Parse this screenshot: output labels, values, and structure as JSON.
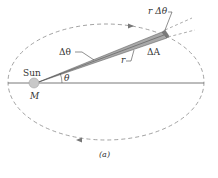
{
  "labels": {
    "r_delta_theta": "r Δθ",
    "delta_theta": "Δθ",
    "delta_A": "ΔA",
    "r": "r",
    "sun": "Sun",
    "mass": "M",
    "theta": "θ",
    "caption": "(a)"
  },
  "colors": {
    "orbit": "#8a8a8a",
    "axis": "#555555",
    "wedge_fill": "#a9a9a9",
    "wedge_edge": "#555555",
    "sun": "#c8c8c8",
    "text": "#333333"
  }
}
